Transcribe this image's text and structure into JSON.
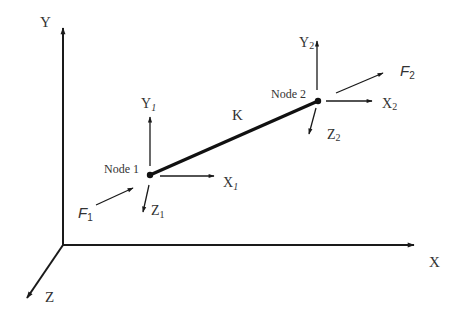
{
  "diagram": {
    "type": "3D spring element with two nodes in a global coordinate system",
    "colors": {
      "stroke": "#1a1a1a",
      "text": "#333333",
      "background": "#ffffff"
    },
    "global_axes": {
      "origin": [
        63,
        245
      ],
      "x": {
        "label": "X",
        "end": [
          414,
          245
        ]
      },
      "y": {
        "label": "Y",
        "end": [
          63,
          28
        ]
      },
      "z": {
        "label": "Z",
        "end": [
          27,
          298
        ]
      }
    },
    "element": {
      "label": "K",
      "from_node": 1,
      "to_node": 2
    },
    "nodes": [
      {
        "id": 1,
        "label": "Node 1",
        "position": [
          150,
          175
        ],
        "axes": {
          "x": {
            "base": "X",
            "sub": "1"
          },
          "y": {
            "base": "Y",
            "sub": "1"
          },
          "z": {
            "base": "Z",
            "sub": "1"
          }
        },
        "force": {
          "base": "F",
          "sub": "1"
        }
      },
      {
        "id": 2,
        "label": "Node 2",
        "position": [
          318,
          101
        ],
        "axes": {
          "x": {
            "base": "X",
            "sub": "2"
          },
          "y": {
            "base": "Y",
            "sub": "2"
          },
          "z": {
            "base": "Z",
            "sub": "2"
          }
        },
        "force": {
          "base": "F",
          "sub": "2"
        }
      }
    ]
  }
}
